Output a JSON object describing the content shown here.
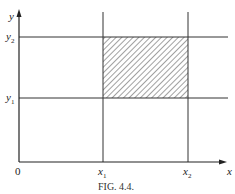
{
  "figure": {
    "caption": "Fig. 4.4.",
    "caption_display": "FIG. 4.4.",
    "axes": {
      "x_label": "x",
      "y_label": "y",
      "origin_label": "0"
    },
    "ticks": {
      "x1": "x",
      "x1_sub": "1",
      "x2": "x",
      "x2_sub": "2",
      "y1": "y",
      "y1_sub": "1",
      "y2": "y",
      "y2_sub": "2"
    },
    "region": {
      "description": "hatched rectangle x1 ≤ x ≤ x2, y1 ≤ y ≤ y2",
      "fill": "diagonal-hatch",
      "line_color": "#333333"
    },
    "colors": {
      "ink": "#222222",
      "background": "#ffffff"
    }
  }
}
